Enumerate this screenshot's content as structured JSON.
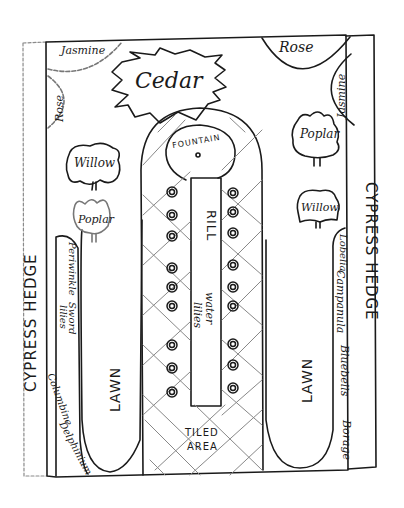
{
  "diagram": {
    "type": "garden-plan-sketch",
    "colors": {
      "ink": "#1a1a1a",
      "paper": "#ffffff",
      "faint_ink": "#9a9a9a"
    }
  },
  "borders": {
    "left_hedge": "CYPRESS HEDGE",
    "right_hedge": "CYPRESS HEDGE"
  },
  "corners": {
    "top_left_jasmine": "Jasmine",
    "top_left_rose": "Rose",
    "top_right_rose": "Rose",
    "top_right_jasmine": "Jasmine"
  },
  "trees": {
    "cedar": "Cedar",
    "left_willow": "Willow",
    "left_poplar": "Poplar",
    "right_poplar": "Poplar",
    "right_willow": "Willow"
  },
  "center": {
    "fountain": "FOUNTAIN",
    "rill": "RILL",
    "water_lilies_line1": "water",
    "water_lilies_line2": "lilies",
    "tiled_area_line1": "TILED",
    "tiled_area_line2": "AREA",
    "left_rings_count": 9,
    "right_rings_count": 9
  },
  "lawns": {
    "left": "LAWN",
    "right": "LAWN"
  },
  "beds": {
    "left": [
      "Periwinkle",
      "Sword",
      "lilies",
      "Columbine",
      "Delphinium"
    ],
    "right": [
      "Lobelia,",
      "Campanula",
      "Bluebells",
      "Borage"
    ]
  }
}
